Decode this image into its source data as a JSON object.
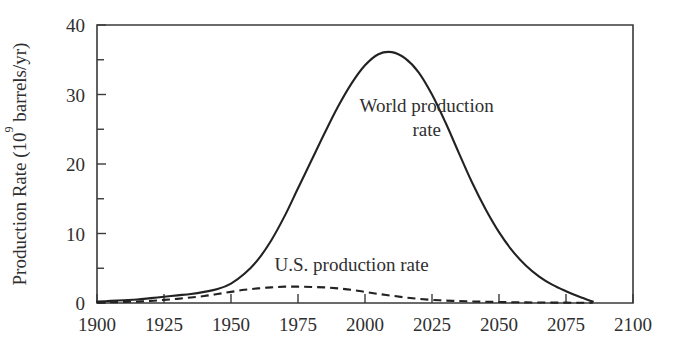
{
  "chart_data": {
    "type": "line",
    "title": "",
    "subtitle": "",
    "xlabel": "",
    "ylabel": "Production Rate (10⁹ barrels/yr)",
    "ylabel_parts": {
      "prefix": "Production Rate (10",
      "superscript": "9",
      "suffix": " barrels/yr)"
    },
    "xlim": [
      1900,
      2100
    ],
    "ylim": [
      0,
      40
    ],
    "xticks": [
      1900,
      1925,
      1950,
      1975,
      2000,
      2025,
      2050,
      2075,
      2100
    ],
    "xticklabels": [
      "1900",
      "1925",
      "1950",
      "1975",
      "2000",
      "2025",
      "2050",
      "2075",
      "2100"
    ],
    "yticks": [
      0,
      10,
      20,
      30,
      40
    ],
    "yticklabels": [
      "0",
      "10",
      "20",
      "30",
      "40"
    ],
    "yminorticks": [
      5,
      15,
      25,
      35
    ],
    "grid": false,
    "legend_position": "inline-annotations",
    "x": [
      1900,
      1905,
      1910,
      1915,
      1920,
      1925,
      1930,
      1935,
      1940,
      1945,
      1950,
      1955,
      1960,
      1965,
      1970,
      1975,
      1980,
      1985,
      1990,
      1995,
      2000,
      2005,
      2010,
      2015,
      2020,
      2025,
      2030,
      2035,
      2040,
      2045,
      2050,
      2055,
      2060,
      2065,
      2070,
      2075,
      2080,
      2085
    ],
    "series": [
      {
        "name": "World production rate",
        "style": "solid",
        "color": "#222222",
        "values": [
          0.2,
          0.3,
          0.4,
          0.5,
          0.7,
          0.9,
          1.1,
          1.3,
          1.6,
          2.0,
          2.8,
          4.2,
          6.2,
          9.0,
          12.5,
          16.5,
          20.5,
          24.5,
          28.3,
          31.6,
          34.2,
          35.8,
          36.1,
          35.2,
          33.2,
          30.0,
          26.0,
          21.6,
          17.3,
          13.5,
          10.2,
          7.5,
          5.4,
          3.8,
          2.6,
          1.7,
          0.9,
          0.2
        ]
      },
      {
        "name": "U.S. production rate",
        "style": "dashed",
        "color": "#222222",
        "values": [
          0.05,
          0.1,
          0.15,
          0.2,
          0.3,
          0.45,
          0.6,
          0.8,
          1.0,
          1.3,
          1.6,
          1.9,
          2.1,
          2.25,
          2.35,
          2.35,
          2.3,
          2.25,
          2.1,
          1.9,
          1.6,
          1.3,
          1.05,
          0.8,
          0.6,
          0.45,
          0.35,
          0.28,
          0.22,
          0.18,
          0.14,
          0.11,
          0.09,
          0.07,
          0.06,
          0.05,
          0.04,
          0.03
        ]
      }
    ],
    "annotations": [
      {
        "id": "world-annotation",
        "lines": [
          "World production",
          "rate"
        ],
        "x": 2023,
        "y": 27.5
      },
      {
        "id": "us-annotation",
        "lines": [
          "U.S. production rate"
        ],
        "x": 1995,
        "y": 4.6
      }
    ]
  }
}
